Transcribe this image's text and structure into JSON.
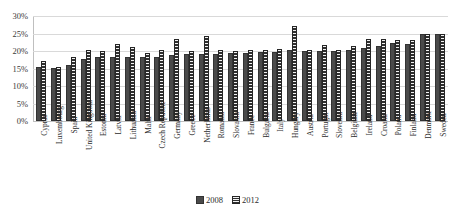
{
  "chart_data": {
    "type": "bar",
    "title": "",
    "subtitle": "",
    "xlabel": "",
    "ylabel": "",
    "ylim": [
      0,
      30
    ],
    "ytick_labels": [
      "0%",
      "5%",
      "10%",
      "15%",
      "20%",
      "25%",
      "30%"
    ],
    "ytick_values": [
      0,
      5,
      10,
      15,
      20,
      25,
      30
    ],
    "grid": true,
    "legend_position": "bottom",
    "categories": [
      "Cyprus",
      "Luxembourg",
      "Spain",
      "United Kingdom",
      "Estonia",
      "Latvia",
      "Lithuania",
      "Malta",
      "Czech Republic",
      "Germany",
      "Greece",
      "Netherlands",
      "Romania",
      "Slovakia",
      "France",
      "Bulgaria",
      "Italy",
      "Hungary",
      "Austria",
      "Portugal",
      "Slovenia",
      "Belgium",
      "Ireland",
      "Croatia",
      "Poland",
      "Finland",
      "Denmark",
      "Sweden"
    ],
    "series": [
      {
        "name": "2008",
        "color": "#4a4a4a",
        "values": [
          15.5,
          15.2,
          16.1,
          17.7,
          18.3,
          18.2,
          18.2,
          18.2,
          18.2,
          19.0,
          19.2,
          19.2,
          19.2,
          19.3,
          19.4,
          19.6,
          19.8,
          20.2,
          20.0,
          20.0,
          20.1,
          20.3,
          21.0,
          21.5,
          22.2,
          22.0,
          24.8,
          24.9
        ]
      },
      {
        "name": "2012",
        "color": "#2f2f2f",
        "values": [
          17.1,
          15.3,
          18.3,
          20.2,
          20.1,
          22.0,
          21.2,
          19.4,
          20.3,
          23.3,
          19.9,
          24.2,
          20.2,
          20.0,
          20.2,
          20.4,
          20.5,
          27.2,
          20.2,
          21.6,
          20.2,
          21.3,
          23.3,
          23.4,
          23.2,
          23.2,
          24.8,
          24.9
        ]
      }
    ]
  },
  "legend": {
    "items": [
      {
        "label": "2008"
      },
      {
        "label": "2012"
      }
    ]
  }
}
